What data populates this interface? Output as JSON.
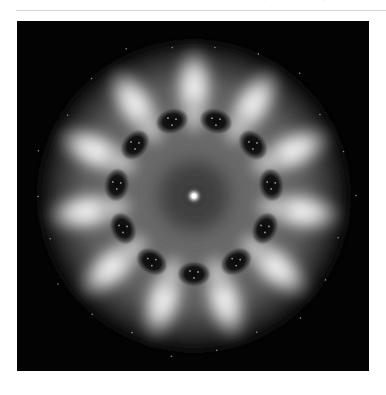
{
  "header": {
    "cut_off_text": "· — — · —"
  },
  "figure": {
    "symmetry_order": 11,
    "center": [
      177,
      175
    ],
    "colors": {
      "background": "#030303",
      "petal": "#f2f2f2",
      "halo": "#7a7a7a",
      "inner_ring": "#3a3a3a",
      "dark_spot": "#0a0a0a",
      "center_spot": "#ffffff"
    },
    "petal_radius": 108,
    "spot_radius": 78,
    "spot_angle_offset_deg": 16.36
  }
}
